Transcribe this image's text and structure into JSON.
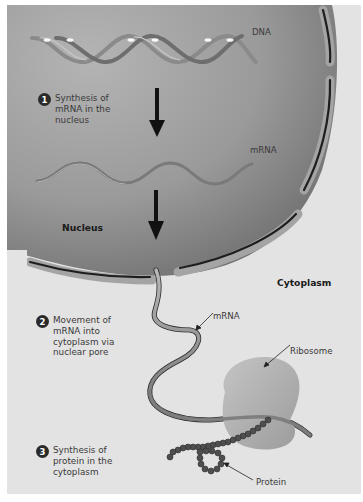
{
  "figure": {
    "labels": {
      "dna": "DNA",
      "mrna_nucleus": "mRNA",
      "nucleus": "Nucleus",
      "cytoplasm": "Cytoplasm",
      "mrna_cytoplasm": "mRNA",
      "ribosome": "Ribosome",
      "protein": "Protein"
    },
    "steps": [
      {
        "number": "1",
        "text": "Synthesis of\nmRNA in the\nnucleus"
      },
      {
        "number": "2",
        "text": "Movement of\nmRNA into\ncytoplasm via\nnuclear pore"
      },
      {
        "number": "3",
        "text": "Synthesis of\nprotein in the\ncytoplasm"
      }
    ],
    "colors": {
      "panel_bg": "#e3e3e3",
      "nucleus_light": "#b0b0b0",
      "nucleus_dark": "#6e6e6e",
      "envelope": "#9a9a9a",
      "membrane_line": "#1e1e1e",
      "ribosome": "#b5b5b5",
      "protein_bead": "#555555"
    }
  }
}
